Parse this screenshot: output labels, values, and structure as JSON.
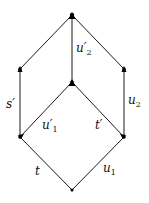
{
  "diagram": {
    "nodes": [
      {
        "id": "top",
        "x": 72,
        "y": 15
      },
      {
        "id": "upper_left",
        "x": 20,
        "y": 69
      },
      {
        "id": "upper_right",
        "x": 124,
        "y": 69
      },
      {
        "id": "middle",
        "x": 72,
        "y": 82
      },
      {
        "id": "lower_left",
        "x": 20,
        "y": 137
      },
      {
        "id": "lower_right",
        "x": 124,
        "y": 137
      },
      {
        "id": "bottom",
        "x": 72,
        "y": 190
      }
    ],
    "edges": [
      {
        "from": "bottom",
        "to": "lower_left",
        "label": "t"
      },
      {
        "from": "bottom",
        "to": "lower_right",
        "label": "u",
        "sub": "1"
      },
      {
        "from": "lower_left",
        "to": "middle",
        "label": "u′",
        "sub": "1"
      },
      {
        "from": "lower_right",
        "to": "middle",
        "label": "t′"
      },
      {
        "from": "lower_left",
        "to": "upper_left",
        "label": "s′"
      },
      {
        "from": "lower_right",
        "to": "upper_right",
        "label": "u",
        "sub": "2"
      },
      {
        "from": "middle",
        "to": "top",
        "label": "u′",
        "sub": "2"
      },
      {
        "from": "upper_left",
        "to": "top",
        "label": ""
      },
      {
        "from": "upper_right",
        "to": "top",
        "label": ""
      }
    ],
    "labels": {
      "t": "t",
      "u1": "u",
      "u1_sub": "1",
      "u1p": "u′",
      "u1p_sub": "1",
      "tp": "t′",
      "sp": "s′",
      "u2": "u",
      "u2_sub": "2",
      "u2p": "u′",
      "u2p_sub": "2"
    },
    "colors": {
      "line": "#1a1a1a",
      "node": "#000000"
    }
  }
}
